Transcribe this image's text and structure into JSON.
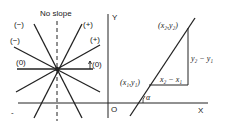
{
  "left_diagram": {
    "title": "No slope",
    "labels": {
      "neg_steep": "(−)",
      "neg_shallow": "(−)",
      "pos_steep": "(+)",
      "pos_shallow": "(+)",
      "zero_left": "(0)",
      "zero_right": "(0)"
    }
  },
  "right_diagram": {
    "y_axis": "Y",
    "x_axis": "X",
    "origin": "O",
    "point1": "(x₁,y₁)",
    "point2": "(x₂,y₂)",
    "rise": "y₂ − y₁",
    "run": "x₂ − x₁",
    "angle": "α"
  }
}
